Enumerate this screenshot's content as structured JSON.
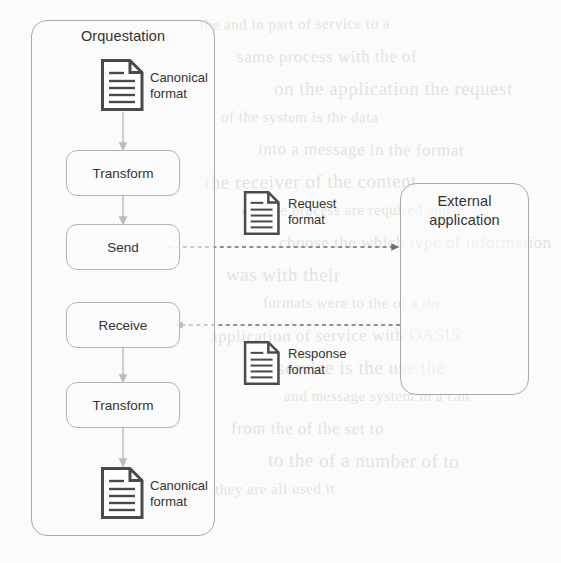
{
  "diagram": {
    "containers": [
      {
        "id": "orquestation",
        "label": "Orquestation"
      },
      {
        "id": "external",
        "label": "External\napplication"
      }
    ],
    "nodes": [
      {
        "id": "transform-top",
        "label": "Transform"
      },
      {
        "id": "send",
        "label": "Send"
      },
      {
        "id": "receive",
        "label": "Receive"
      },
      {
        "id": "transform-bottom",
        "label": "Transform"
      }
    ],
    "documents": [
      {
        "id": "canonical-in",
        "label": "Canonical\nformat",
        "icon": "document-icon"
      },
      {
        "id": "request",
        "label": "Request\nformat",
        "icon": "document-icon"
      },
      {
        "id": "response",
        "label": "Response\nformat",
        "icon": "document-icon"
      },
      {
        "id": "canonical-out",
        "label": "Canonical\nformat",
        "icon": "document-icon"
      }
    ],
    "connectors": [
      {
        "id": "canonical-to-transform",
        "style": "solid",
        "direction": "down"
      },
      {
        "id": "transform-to-send",
        "style": "solid",
        "direction": "down"
      },
      {
        "id": "send-to-external",
        "style": "dashed",
        "direction": "right"
      },
      {
        "id": "external-to-receive",
        "style": "dashed",
        "direction": "left"
      },
      {
        "id": "receive-to-transform",
        "style": "solid",
        "direction": "down"
      },
      {
        "id": "transform-to-canonical",
        "style": "solid",
        "direction": "down"
      }
    ],
    "colors": {
      "page_background": "#fbfbfa",
      "container_stroke": "#a9a9a9",
      "node_stroke": "#b4b4b4",
      "connector": "#6f6f6f",
      "doc_icon": "#4a4a4a",
      "text": "#333333"
    }
  },
  "bleed_text": {
    "lines": [
      "the and in part of service to a",
      "same process with the of",
      "on the application the request",
      "of the system is the data",
      "into a message in the format",
      "the receiver of the content",
      "change process are required and",
      "choose the which type of information",
      "was with their",
      "formats were to the of a the",
      "application of service with OASIS",
      "the service is the use the",
      "and message system in a can",
      "from the of the set to",
      "to the of a number of to",
      "they are all used it"
    ]
  }
}
